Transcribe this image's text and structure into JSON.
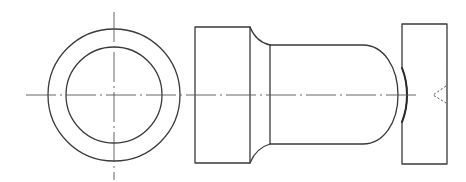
{
  "figure": {
    "colors": {
      "line": "#3a3a3a",
      "background": "#ffffff"
    }
  },
  "views": {
    "end_view": {
      "label": "end-view",
      "center": [
        114,
        95
      ],
      "outer_radius": 66,
      "inner_radius": 48
    },
    "side_view": {
      "label": "side-view",
      "head": {
        "x": 195,
        "y": 27,
        "w": 55,
        "h": 136
      },
      "shaft": {
        "x_start": 270,
        "y_top": 45,
        "y_bottom": 144,
        "dome_tip_x": 398
      },
      "block": {
        "x": 402,
        "y": 24,
        "w": 45,
        "h": 140
      }
    }
  }
}
